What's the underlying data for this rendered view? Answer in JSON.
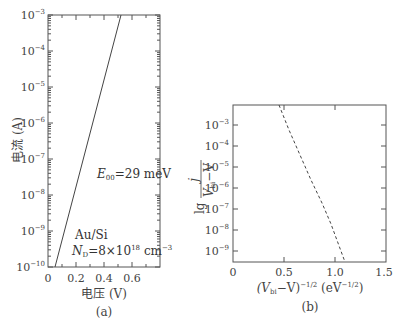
{
  "chart_data": [
    {
      "panel": "(a)",
      "type": "line",
      "title": "",
      "xlabel": "电压 (V)",
      "ylabel": "电流 (A)",
      "yscale": "log",
      "xlim": [
        0,
        0.8
      ],
      "ylim": [
        1e-10,
        0.001
      ],
      "xticks": [
        "0",
        "0.2",
        "0.4",
        "0.6"
      ],
      "yticks": [
        "10^-10",
        "10^-9",
        "10^-8",
        "10^-7",
        "10^-6",
        "10^-5",
        "10^-4",
        "10^-3"
      ],
      "series": [
        {
          "name": "I-V (Au/Si)",
          "style": "solid",
          "x": [
            0.05,
            0.15,
            0.25,
            0.35,
            0.45,
            0.53
          ],
          "y": [
            1e-10,
            1e-08,
            1e-06,
            1e-05,
            0.0002,
            0.001
          ]
        }
      ],
      "annotations": [
        "E00=29 meV",
        "Au/Si",
        "ND=8×10^18 cm^-3"
      ],
      "grid": false,
      "legend": null
    },
    {
      "panel": "(b)",
      "type": "line",
      "title": "",
      "xlabel": "(Vbi−V)^-1/2 (eV^-1/2)",
      "ylabel": "lg j/(Vbi−V)",
      "yscale": "log",
      "xlim": [
        0,
        1.5
      ],
      "ylim": [
        1e-10,
        0.01
      ],
      "xticks": [
        "0",
        "0.5",
        "1.0",
        "1.5"
      ],
      "yticks": [
        "10^-9",
        "10^-8",
        "10^-7",
        "10^-6",
        "10^-5",
        "10^-4",
        "10^-3"
      ],
      "series": [
        {
          "name": "lg j/(Vbi−V)",
          "style": "dashed",
          "x": [
            0.47,
            0.6,
            0.75,
            0.9,
            1.0,
            1.1
          ],
          "y": [
            0.01,
            0.0001,
            1e-06,
            1e-07,
            1e-08,
            1e-10
          ]
        }
      ],
      "annotations": [],
      "grid": false,
      "legend": null
    }
  ],
  "panels": {
    "a": {
      "label": "(a)",
      "xlabel": "电压 (V)",
      "ylabel": "电流 (A)",
      "xticks": [
        "0",
        "0.2",
        "0.4",
        "0.6"
      ],
      "yticks": [
        {
          "base": "10",
          "exp": "−10"
        },
        {
          "base": "10",
          "exp": "−9"
        },
        {
          "base": "10",
          "exp": "−8"
        },
        {
          "base": "10",
          "exp": "−7"
        },
        {
          "base": "10",
          "exp": "−6"
        },
        {
          "base": "10",
          "exp": "−5"
        },
        {
          "base": "10",
          "exp": "−4"
        },
        {
          "base": "10",
          "exp": "−3"
        }
      ],
      "annot_e00_sym": "E",
      "annot_e00_sub": "00",
      "annot_e00_val": "=29 meV",
      "annot_material": "Au/Si",
      "annot_nd_sym": "N",
      "annot_nd_sub": "D",
      "annot_nd_val": "=8×10",
      "annot_nd_exp": "18",
      "annot_nd_unit": " cm",
      "annot_nd_unit_exp": "−3"
    },
    "b": {
      "label": "(b)",
      "xticks": [
        "0",
        "0.5",
        "1.0",
        "1.5"
      ],
      "yticks": [
        {
          "base": "10",
          "exp": "−9"
        },
        {
          "base": "10",
          "exp": "−8"
        },
        {
          "base": "10",
          "exp": "−7"
        },
        {
          "base": "10",
          "exp": "−6"
        },
        {
          "base": "10",
          "exp": "−5"
        },
        {
          "base": "10",
          "exp": "−4"
        },
        {
          "base": "10",
          "exp": "−3"
        }
      ],
      "ylabel_lg": "lg",
      "ylabel_num": "j",
      "ylabel_den": "V",
      "ylabel_den_sub": "bi",
      "ylabel_den_rest": "−V",
      "xlabel_open": "(V",
      "xlabel_sub": "bi",
      "xlabel_mid": "−V)",
      "xlabel_exp": "−1/2",
      "xlabel_unit": " (eV",
      "xlabel_unit_exp": "−1/2",
      "xlabel_close": ")"
    }
  }
}
